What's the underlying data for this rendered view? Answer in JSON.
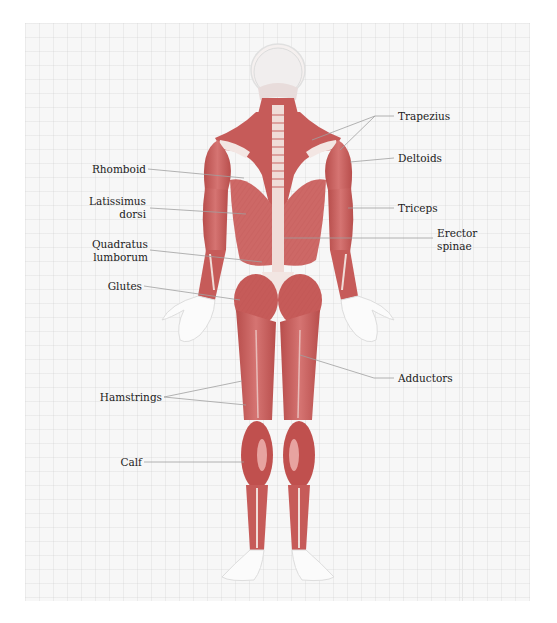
{
  "diagram": {
    "title": "",
    "view": "posterior muscle anatomy",
    "colors": {
      "muscle": "#c9605f",
      "muscle_dark": "#a8413f",
      "muscle_light": "#e7a3a0",
      "tendon": "#f1e3df",
      "skin_outline": "#e4e4e4",
      "background": "#f7f7f7",
      "leader_line": "#9a9a9a",
      "text": "#222222"
    },
    "labels_left": [
      {
        "id": "rhomboid",
        "text": "Rhomboid"
      },
      {
        "id": "latissimus",
        "line1": "Latissimus",
        "line2": "dorsi"
      },
      {
        "id": "quadratus",
        "line1": "Quadratus",
        "line2": "lumborum"
      },
      {
        "id": "glutes",
        "text": "Glutes"
      },
      {
        "id": "hamstrings",
        "text": "Hamstrings"
      },
      {
        "id": "calf",
        "text": "Calf"
      }
    ],
    "labels_right": [
      {
        "id": "trapezius",
        "text": "Trapezius"
      },
      {
        "id": "deltoids",
        "text": "Deltoids"
      },
      {
        "id": "triceps",
        "text": "Triceps"
      },
      {
        "id": "erector",
        "line1": "Erector",
        "line2": "spinae"
      },
      {
        "id": "adductors",
        "text": "Adductors"
      }
    ]
  }
}
